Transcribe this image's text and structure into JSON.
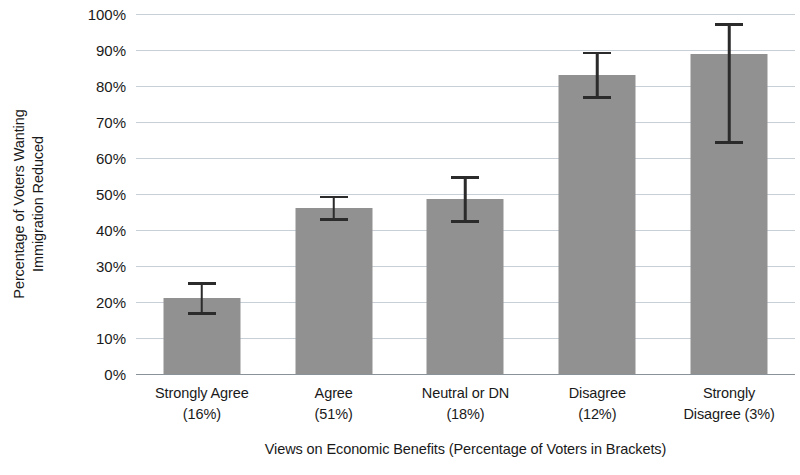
{
  "chart_data": {
    "type": "bar",
    "title": "",
    "xlabel": "Views on Economic Benefits (Percentage of Voters in Brackets)",
    "ylabel_line1": "Percentage of Voters Wanting",
    "ylabel_line2": "Immigration Reduced",
    "categories": [
      "Strongly Agree (16%)",
      "Agree (51%)",
      "Neutral or DN (18%)",
      "Disagree (12%)",
      "Strongly Disagree (3%)"
    ],
    "category_lines": [
      [
        "Strongly Agree",
        "(16%)"
      ],
      [
        "Agree",
        "(51%)"
      ],
      [
        "Neutral or DN",
        "(18%)"
      ],
      [
        "Disagree",
        "(12%)"
      ],
      [
        "Strongly",
        "Disagree (3%)"
      ]
    ],
    "values": [
      21,
      46,
      48.5,
      83,
      89
    ],
    "error_low": [
      16.5,
      42.5,
      42,
      76.5,
      64
    ],
    "error_high": [
      25.5,
      49.5,
      55,
      89.5,
      97.5
    ],
    "ylim": [
      0,
      100
    ],
    "ytick_labels": [
      "100%",
      "90%",
      "80%",
      "70%",
      "60%",
      "50%",
      "40%",
      "30%",
      "20%",
      "10%",
      "0%"
    ],
    "ytick_values": [
      100,
      90,
      80,
      70,
      60,
      50,
      40,
      30,
      20,
      10,
      0
    ],
    "grid": true,
    "legend": "none",
    "bar_color": "#919191",
    "grid_color": "#c9cfd6",
    "error_color": "#2b2b2b",
    "axis_color": "#8b9198"
  }
}
